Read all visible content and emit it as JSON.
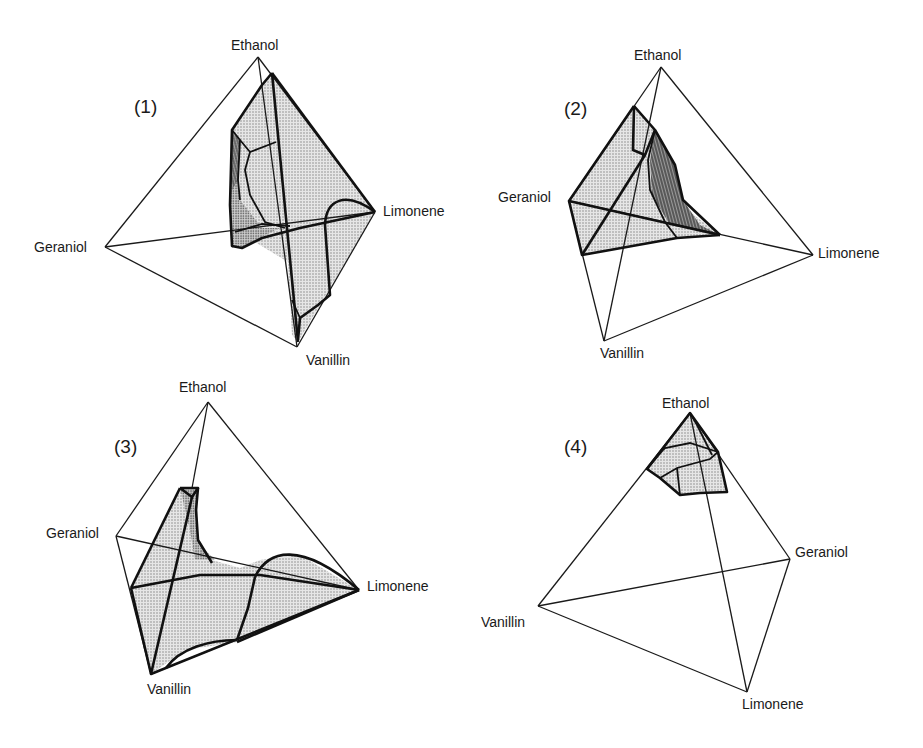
{
  "figure": {
    "panels": [
      {
        "id": "1",
        "label": "(1)",
        "vertices": {
          "ethanol": "Ethanol",
          "limonene": "Limonene",
          "geraniol": "Geraniol",
          "vanillin": "Vanillin"
        }
      },
      {
        "id": "2",
        "label": "(2)",
        "vertices": {
          "ethanol": "Ethanol",
          "limonene": "Limonene",
          "geraniol": "Geraniol",
          "vanillin": "Vanillin"
        }
      },
      {
        "id": "3",
        "label": "(3)",
        "vertices": {
          "ethanol": "Ethanol",
          "limonene": "Limonene",
          "geraniol": "Geraniol",
          "vanillin": "Vanillin"
        }
      },
      {
        "id": "4",
        "label": "(4)",
        "vertices": {
          "ethanol": "Ethanol",
          "geraniol": "Geraniol",
          "vanillin": "Vanillin",
          "limonene": "Limonene"
        }
      }
    ],
    "colors": {
      "line": "#1a1a1a",
      "shading": "#9a9a9a",
      "background": "#ffffff"
    }
  }
}
